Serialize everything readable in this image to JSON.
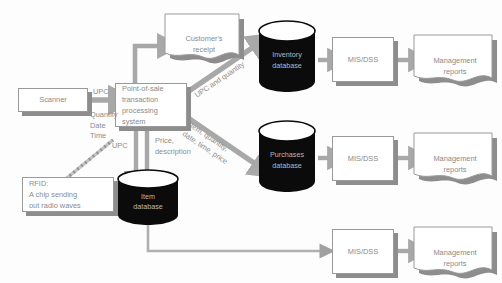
{
  "diagram": {
    "background_color": "#fdfdfd",
    "node_fill": "#ffffff",
    "node_border": "#9a9a9a",
    "shadow_color": "#8d8d8d",
    "text_color": "#8a8a8a",
    "cylinder_fill": "#0b0b0b",
    "cylinder_text_color": "#b8b8b8",
    "arrow_color": "#a8a8a8"
  },
  "nodes": {
    "scanner": {
      "label": "Scanner"
    },
    "rfid": {
      "label": "RFID:\nA chip sending\nout radio waves"
    },
    "pos": {
      "label": "Point-of-sale\ntransaction\nprocessing\nsystem"
    },
    "receipt": {
      "label": "Customer's\nreceipt"
    },
    "item_db": {
      "label": "Item\ndatabase"
    },
    "inventory_db": {
      "label": "Inventory\ndatabase"
    },
    "purchases_db": {
      "label": "Purchases\ndatabase"
    },
    "mis_top": {
      "label": "MIS/DSS"
    },
    "mis_middle": {
      "label": "MIS/DSS"
    },
    "mis_bottom": {
      "label": "MIS/DSS"
    },
    "reports_top": {
      "label": "Management\nreports"
    },
    "reports_middle": {
      "label": "Management\nreports"
    },
    "reports_bottom": {
      "label": "Management\nreports"
    }
  },
  "edge_labels": {
    "scanner_upc": "UPC",
    "scanner_details": "Quantity\nDate\nTime",
    "pos_to_item_upc": "UPC",
    "item_to_pos_price": "Price,\ndescription",
    "pos_to_inventory": "UPC and quantity",
    "pos_to_purchases": "Item, quantity,\ndate, time, price"
  }
}
